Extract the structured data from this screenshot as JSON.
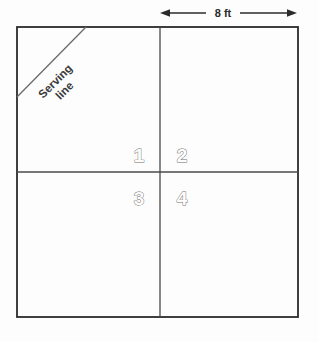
{
  "diagram": {
    "dimension": {
      "label": "8 ft",
      "arrow_name": "double-headed-arrow"
    },
    "serving_line": {
      "line1": "Serving",
      "line2": "line"
    },
    "regions": [
      {
        "id": "1",
        "label": "1",
        "position": "top-left-quadrant-inner"
      },
      {
        "id": "2",
        "label": "2",
        "position": "top-right-quadrant-inner"
      },
      {
        "id": "3",
        "label": "3",
        "position": "bottom-left-quadrant-inner"
      },
      {
        "id": "4",
        "label": "4",
        "position": "bottom-right-quadrant-inner"
      }
    ],
    "colors": {
      "outline": "#2b2b2b",
      "divider": "#4a4a4a",
      "serving_line_stroke": "#6a6a6a",
      "label_outline": "#6e6e6e",
      "background": "#fdfdfd",
      "text": "#2b2b2b"
    },
    "geometry": {
      "square": {
        "x": 17,
        "y": 27,
        "width": 281,
        "height": 290
      },
      "vertical_divider_x": 160,
      "horizontal_divider_y": 172,
      "serving_diagonal": {
        "x1": 17,
        "y1": 97,
        "x2": 86,
        "y2": 27
      },
      "dimension_line": {
        "x1": 160,
        "x2": 297,
        "y": 13
      }
    }
  }
}
